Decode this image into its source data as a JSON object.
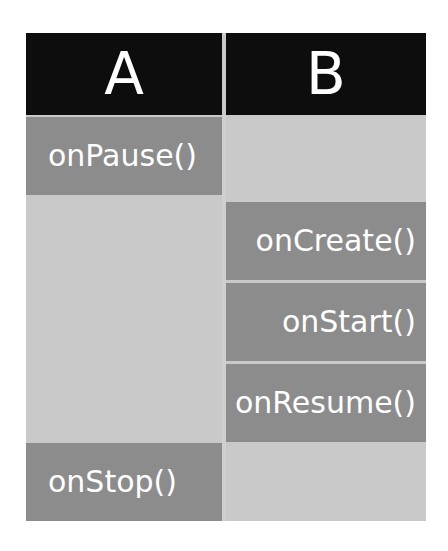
{
  "table": {
    "columns": [
      {
        "id": "A",
        "header": "A"
      },
      {
        "id": "B",
        "header": "B"
      }
    ],
    "column_a": {
      "cells": [
        {
          "label": "onPause()",
          "filled": true
        },
        {
          "label": "",
          "filled": false
        },
        {
          "label": "onStop()",
          "filled": true
        }
      ]
    },
    "column_b": {
      "cells": [
        {
          "label": "",
          "filled": false
        },
        {
          "label": "onCreate()",
          "filled": true
        },
        {
          "label": "onStart()",
          "filled": true
        },
        {
          "label": "onResume()",
          "filled": true
        },
        {
          "label": "",
          "filled": false
        }
      ]
    }
  },
  "colors": {
    "page_background": "#ffffff",
    "header_background": "#0d0d0d",
    "header_text": "#ffffff",
    "cell_empty_background": "#c9c9c9",
    "cell_filled_background": "#8c8c8c",
    "cell_text": "#ffffff"
  }
}
